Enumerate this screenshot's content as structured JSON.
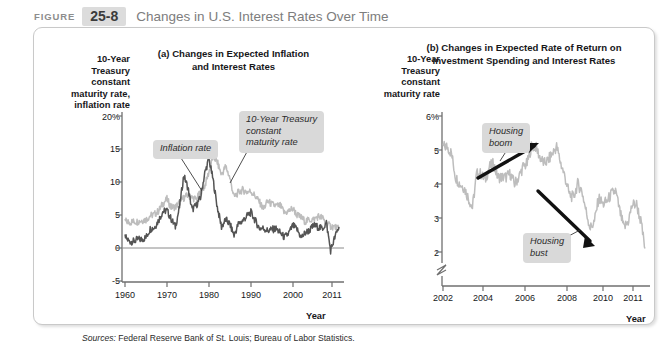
{
  "header": {
    "figure_word": "Figure",
    "figure_number": "25-8",
    "title": "Changes in U.S. Interest Rates Over Time"
  },
  "sources": {
    "label": "Sources:",
    "text": " Federal Reserve Bank of St. Louis; Bureau of Labor Statistics."
  },
  "colors": {
    "inflation_line": "#545454",
    "treasury_line": "#bdbdbd",
    "callout_bg": "#d9d9d9",
    "axis": "#6f6f6f",
    "arrow": "#111111",
    "figure_number_bg": "#dcdcdc",
    "title_text": "#7d7d7d",
    "panel_border": "#c9c9c9"
  },
  "panel_a": {
    "title": "(a) Changes in Expected Inflation\nand Interest Rates",
    "ylabel": "10-Year\nTreasury\nconstant\nmaturity rate,\ninflation rate",
    "xlabel": "Year",
    "callouts": [
      {
        "name": "inflation-rate-callout",
        "text": "Inflation rate"
      },
      {
        "name": "treasury-rate-callout",
        "text": "10-Year Treasury\nconstant\nmaturity rate"
      }
    ],
    "yticks": [
      "20%",
      "15",
      "10",
      "5",
      "0",
      "-5"
    ],
    "xticks": [
      "1960",
      "1970",
      "1980",
      "1990",
      "2000",
      "2011"
    ]
  },
  "panel_b": {
    "title": "(b) Changes in Expected Rate of Return on\nInvestment Spending and Interest Rates",
    "ylabel": "10-Year\nTreasury\nconstant\nmaturity rate",
    "xlabel": "Year",
    "callouts": [
      {
        "name": "housing-boom-callout",
        "text": "Housing\nboom"
      },
      {
        "name": "housing-bust-callout",
        "text": "Housing\nbust"
      }
    ],
    "yticks": [
      "6%",
      "5",
      "4",
      "3",
      "2"
    ],
    "xticks": [
      "2002",
      "2004",
      "2006",
      "2008",
      "2010",
      "2011"
    ]
  },
  "chart_data": [
    {
      "type": "line",
      "id": "panel-a",
      "title": "(a) Changes in Expected Inflation and Interest Rates",
      "xlabel": "Year",
      "ylabel": "10-Year Treasury constant maturity rate, inflation rate",
      "xlim": [
        1960,
        2011
      ],
      "ylim": [
        -5,
        20
      ],
      "yticks": [
        -5,
        0,
        5,
        10,
        15,
        20
      ],
      "xticks": [
        1960,
        1970,
        1980,
        1990,
        2000,
        2011
      ],
      "grid": false,
      "legend": "annotations",
      "series": [
        {
          "name": "10-Year Treasury constant maturity rate",
          "color": "#bdbdbd",
          "x": [
            1960,
            1961,
            1962,
            1963,
            1964,
            1965,
            1966,
            1967,
            1968,
            1969,
            1970,
            1971,
            1972,
            1973,
            1974,
            1975,
            1976,
            1977,
            1978,
            1979,
            1980,
            1981,
            1982,
            1983,
            1984,
            1985,
            1986,
            1987,
            1988,
            1989,
            1990,
            1991,
            1992,
            1993,
            1994,
            1995,
            1996,
            1997,
            1998,
            1999,
            2000,
            2001,
            2002,
            2003,
            2004,
            2005,
            2006,
            2007,
            2008,
            2009,
            2010,
            2011
          ],
          "values": [
            4.1,
            3.9,
            4.0,
            4.0,
            4.2,
            4.3,
            4.9,
            5.1,
            5.6,
            6.7,
            7.4,
            6.2,
            6.2,
            6.9,
            7.6,
            8.0,
            7.6,
            7.4,
            8.4,
            9.4,
            11.5,
            13.9,
            13.0,
            11.1,
            12.4,
            10.6,
            7.7,
            8.4,
            8.8,
            8.5,
            8.6,
            7.9,
            7.0,
            5.9,
            7.1,
            6.6,
            6.4,
            6.4,
            5.3,
            5.6,
            6.0,
            5.0,
            4.6,
            4.0,
            4.3,
            4.3,
            4.8,
            4.6,
            3.7,
            3.3,
            3.2,
            2.8
          ]
        },
        {
          "name": "Inflation rate",
          "color": "#545454",
          "x": [
            1960,
            1961,
            1962,
            1963,
            1964,
            1965,
            1966,
            1967,
            1968,
            1969,
            1970,
            1971,
            1972,
            1973,
            1974,
            1975,
            1976,
            1977,
            1978,
            1979,
            1980,
            1981,
            1982,
            1983,
            1984,
            1985,
            1986,
            1987,
            1988,
            1989,
            1990,
            1991,
            1992,
            1993,
            1994,
            1995,
            1996,
            1997,
            1998,
            1999,
            2000,
            2001,
            2002,
            2003,
            2004,
            2005,
            2006,
            2007,
            2008,
            2009,
            2010,
            2011
          ],
          "values": [
            1.7,
            1.0,
            1.0,
            1.3,
            1.3,
            1.6,
            2.9,
            3.1,
            4.2,
            5.5,
            5.7,
            4.4,
            3.2,
            6.2,
            11.0,
            9.1,
            5.8,
            6.5,
            7.6,
            11.3,
            13.5,
            10.3,
            6.2,
            3.2,
            4.3,
            3.6,
            1.9,
            3.6,
            4.1,
            4.8,
            5.4,
            4.2,
            3.0,
            3.0,
            2.6,
            2.8,
            2.9,
            2.3,
            1.6,
            2.2,
            3.4,
            2.8,
            1.6,
            2.3,
            2.7,
            3.4,
            3.2,
            2.9,
            3.8,
            -0.4,
            1.6,
            3.2
          ]
        }
      ],
      "annotations": [
        {
          "text": "Inflation rate",
          "points_to_series": "Inflation rate",
          "points_to_x": 1974
        },
        {
          "text": "10-Year Treasury constant maturity rate",
          "points_to_series": "10-Year Treasury constant maturity rate",
          "points_to_x": 1986
        }
      ]
    },
    {
      "type": "line",
      "id": "panel-b",
      "title": "(b) Changes in Expected Rate of Return on Investment Spending and Interest Rates",
      "xlabel": "Year",
      "ylabel": "10-Year Treasury constant maturity rate",
      "xlim": [
        2002,
        2011.6
      ],
      "ylim": [
        2,
        6
      ],
      "yticks": [
        2,
        3,
        4,
        5,
        6
      ],
      "xticks": [
        2002,
        2004,
        2006,
        2008,
        2010,
        2011
      ],
      "axis_break": true,
      "grid": false,
      "series": [
        {
          "name": "10-Year Treasury constant maturity rate",
          "color": "#bdbdbd",
          "x": [
            2002.0,
            2002.2,
            2002.4,
            2002.6,
            2002.8,
            2003.0,
            2003.2,
            2003.4,
            2003.6,
            2003.8,
            2004.0,
            2004.2,
            2004.4,
            2004.6,
            2004.8,
            2005.0,
            2005.2,
            2005.4,
            2005.6,
            2005.8,
            2006.0,
            2006.2,
            2006.4,
            2006.6,
            2006.8,
            2007.0,
            2007.2,
            2007.4,
            2007.6,
            2007.8,
            2008.0,
            2008.2,
            2008.4,
            2008.6,
            2008.8,
            2009.0,
            2009.2,
            2009.4,
            2009.6,
            2009.8,
            2010.0,
            2010.2,
            2010.4,
            2010.6,
            2010.8,
            2011.0,
            2011.2,
            2011.4,
            2011.6
          ],
          "values": [
            5.1,
            5.1,
            4.9,
            4.2,
            4.0,
            3.9,
            3.6,
            3.3,
            4.3,
            4.3,
            4.1,
            4.5,
            4.6,
            4.2,
            4.2,
            4.2,
            4.3,
            4.0,
            4.2,
            4.5,
            4.6,
            5.1,
            5.1,
            4.8,
            4.6,
            4.7,
            4.9,
            5.1,
            4.6,
            4.2,
            3.7,
            3.6,
            4.0,
            3.8,
            3.2,
            2.7,
            2.9,
            3.6,
            3.4,
            3.5,
            3.7,
            3.8,
            3.2,
            2.7,
            2.9,
            3.4,
            3.4,
            2.9,
            2.1
          ]
        }
      ],
      "annotations": [
        {
          "text": "Housing boom",
          "arrow": "up-right",
          "from_x": 2003.3,
          "to_x": 2005.6
        },
        {
          "text": "Housing bust",
          "arrow": "down-right",
          "from_x": 2006.0,
          "to_x": 2008.6
        }
      ]
    }
  ]
}
